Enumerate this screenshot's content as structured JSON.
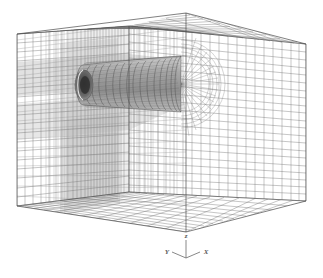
{
  "figure": {
    "title": "",
    "kind": "structured-mesh-3d",
    "background_color": "#ffffff",
    "line_color": "#555555",
    "dense_line_color": "#8a8a8a",
    "shade_color": "#b8b8b8",
    "body_color": "#9a9a9a"
  },
  "axis_triad": {
    "name": "coordinate-axis-triad",
    "z_label": "z",
    "y_label": "Y",
    "x_label": "X",
    "origin": {
      "x": 186,
      "y": 258
    },
    "z_tip": {
      "x": 186,
      "y": 238
    },
    "y_tip": {
      "x": 168,
      "y": 252
    },
    "x_tip": {
      "x": 205,
      "y": 252
    }
  },
  "domain_box": {
    "name": "computational-domain-box",
    "description": "rectangular far-field outer boundary",
    "vertices": {
      "top_apex": {
        "x": 186,
        "y": 13
      },
      "top_left": {
        "x": 17,
        "y": 34
      },
      "top_right": {
        "x": 306,
        "y": 44
      },
      "top_back": {
        "x": 129,
        "y": 26
      },
      "bottom_left": {
        "x": 17,
        "y": 206
      },
      "bottom_front": {
        "x": 186,
        "y": 232
      },
      "bottom_right": {
        "x": 306,
        "y": 201
      },
      "bottom_back": {
        "x": 129,
        "y": 192
      }
    },
    "grid_counts": {
      "left_face_horizontal": 19,
      "left_face_vertical": 26,
      "right_face_horizontal": 20,
      "right_face_vertical": 25,
      "top_face_lines": 22,
      "bottom_face_lines": 22
    }
  },
  "body": {
    "name": "cylindrical-body",
    "description": "axisymmetric cylinder / projectile afterbody with O-grid",
    "nose_center": {
      "x": 83,
      "y": 85
    },
    "tail_center": {
      "x": 181,
      "y": 84
    },
    "nose_radius_y": 20,
    "tail_radius_y": 28,
    "circumferential_rings": 17,
    "longitudinal_lines": 48,
    "cavity": {
      "name": "base-cavity",
      "center": {
        "x": 84,
        "y": 85
      },
      "rx": 9,
      "ry": 15
    }
  },
  "wake": {
    "name": "wake-refinement-region",
    "description": "clustered grid planes trailing the body",
    "density_lines": 46
  }
}
